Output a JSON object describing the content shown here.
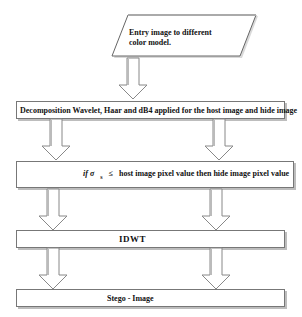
{
  "diagram": {
    "type": "flowchart",
    "start": {
      "label_line1": "Entry image to different",
      "label_line2": "color model.",
      "shape": "parallelogram"
    },
    "steps": [
      {
        "id": "decomposition",
        "label": "Decomposition Wavelet, Haar and dB4 applied for the host image and hide image"
      },
      {
        "id": "condition",
        "label_prefix": "if σ",
        "label_sub": "s",
        "label_op": "≤",
        "label_rest": "host image pixel value then hide image pixel value"
      },
      {
        "id": "idwt",
        "label": "IDWT"
      },
      {
        "id": "stego",
        "label": "Stego - Image"
      }
    ],
    "arrows": [
      {
        "from": "start",
        "to": "decomposition",
        "count": 1
      },
      {
        "from": "decomposition",
        "to": "condition",
        "count": 2
      },
      {
        "from": "condition",
        "to": "idwt",
        "count": 2
      },
      {
        "from": "idwt",
        "to": "stego",
        "count": 2
      }
    ],
    "colors": {
      "border": "#777777",
      "shadow": "#bdbdbd",
      "arrow_fill": "#ffffff",
      "arrow_stroke": "#888888"
    }
  }
}
